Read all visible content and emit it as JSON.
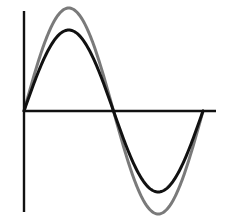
{
  "chart_data": {
    "type": "line",
    "title": "",
    "xlabel": "",
    "ylabel": "",
    "grid": false,
    "legend": null,
    "axes": {
      "origin_px": [
        24,
        111
      ],
      "y_axis_px": {
        "x": 24,
        "top": 11,
        "bottom": 212
      },
      "x_axis_px": {
        "y": 111,
        "left": 24,
        "right": 216
      },
      "color": "#111111",
      "width": 2.4
    },
    "x_range": [
      0,
      360
    ],
    "series": [
      {
        "name": "larger-amplitude sine",
        "color": "#7a7a7a",
        "width": 3,
        "amplitude_px": 103,
        "start_px": 24,
        "period_px": 179,
        "description": "one full period of sine, peak near y=8, trough near y=213"
      },
      {
        "name": "smaller-amplitude sine",
        "color": "#111111",
        "width": 3,
        "amplitude_px": 81,
        "start_px": 24,
        "period_px": 179,
        "description": "one full period of sine, peak near y=32, trough near y=193"
      }
    ],
    "annotations": []
  }
}
